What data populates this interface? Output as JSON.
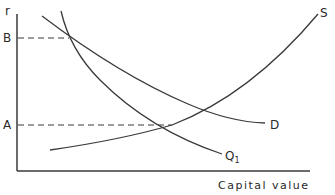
{
  "diagram": {
    "y_axis_label": "r",
    "x_axis_label": "Capital value",
    "y_marks": [
      {
        "id": "B",
        "label": "B"
      },
      {
        "id": "A",
        "label": "A"
      }
    ],
    "curves": [
      {
        "id": "S",
        "label": "S",
        "description": "upward sloping supply curve"
      },
      {
        "id": "D",
        "label": "D",
        "description": "downward sloping demand curve"
      },
      {
        "id": "Q1",
        "label": "Q",
        "subscript": "1",
        "description": "steep downward sloping curve"
      }
    ],
    "line_color": "#3a3a3a"
  }
}
